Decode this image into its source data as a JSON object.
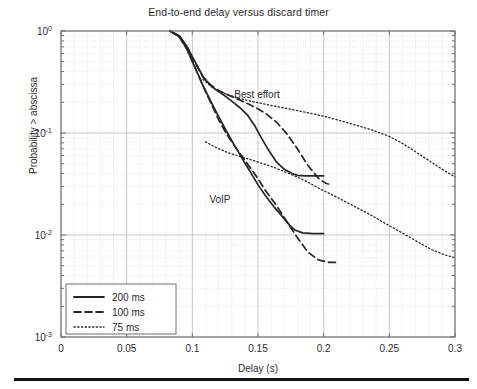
{
  "figure": {
    "title": "End-to-end delay versus discard timer",
    "bottom_rule": true
  },
  "axes": {
    "xlabel": "Delay (s)",
    "ylabel": "Probability > abscissa",
    "x_ticks": [
      "0",
      "0.05",
      "0.1",
      "0.15",
      "0.2",
      "0.25",
      "0.3"
    ],
    "y_ticks": [
      "10",
      "10",
      "10",
      "10"
    ],
    "y_exponents": [
      "0",
      "-1",
      "-2",
      "-3"
    ]
  },
  "legend": {
    "entries": [
      {
        "label": "200 ms",
        "style": "solid"
      },
      {
        "label": "100 ms",
        "style": "dashed"
      },
      {
        "label": "75 ms",
        "style": "dotted"
      }
    ]
  },
  "annotations": [
    {
      "text": "Best effort",
      "x": 0.132,
      "y": 0.22
    },
    {
      "text": "VoIP",
      "x": 0.113,
      "y": 0.0205
    }
  ],
  "colors": {
    "curve": "#262626",
    "axis": "#6f6f6f",
    "grid_major": "#b9b9b9",
    "grid_minor": "#d8d8d8",
    "text": "#2b2b2b",
    "rule": "#111111"
  },
  "chart_data": {
    "type": "line",
    "title": "End-to-end delay versus discard timer",
    "xlabel": "Delay (s)",
    "ylabel": "Probability > abscissa",
    "xlim": [
      0,
      0.3
    ],
    "ylim": [
      0.001,
      1
    ],
    "yscale": "log",
    "xscale": "linear",
    "grid": true,
    "legend_position": "lower-left",
    "legend_entries": [
      "200 ms",
      "100 ms",
      "75 ms"
    ],
    "groups": [
      "Best effort",
      "VoIP"
    ],
    "series": [
      {
        "name": "Best effort 200 ms",
        "group": "Best effort",
        "discard_timer_ms": 200,
        "style": "solid",
        "x": [
          0.083,
          0.09,
          0.096,
          0.102,
          0.108,
          0.113,
          0.118,
          0.124,
          0.13,
          0.136,
          0.142,
          0.148,
          0.152,
          0.158,
          0.164,
          0.17,
          0.176,
          0.18,
          0.186,
          0.192,
          0.2
        ],
        "y": [
          1.0,
          0.9,
          0.7,
          0.5,
          0.36,
          0.3,
          0.265,
          0.235,
          0.205,
          0.178,
          0.15,
          0.115,
          0.092,
          0.068,
          0.052,
          0.044,
          0.04,
          0.0385,
          0.038,
          0.038,
          0.038
        ]
      },
      {
        "name": "Best effort 100 ms",
        "group": "Best effort",
        "discard_timer_ms": 100,
        "style": "dashed",
        "x": [
          0.083,
          0.09,
          0.096,
          0.102,
          0.108,
          0.114,
          0.12,
          0.126,
          0.132,
          0.14,
          0.148,
          0.156,
          0.164,
          0.172,
          0.18,
          0.188,
          0.196,
          0.202,
          0.206
        ],
        "y": [
          1.0,
          0.9,
          0.7,
          0.49,
          0.355,
          0.295,
          0.262,
          0.24,
          0.222,
          0.2,
          0.178,
          0.155,
          0.128,
          0.098,
          0.07,
          0.048,
          0.036,
          0.032,
          0.031
        ]
      },
      {
        "name": "Best effort 75 ms",
        "group": "Best effort",
        "discard_timer_ms": 75,
        "style": "dotted",
        "x": [
          0.108,
          0.116,
          0.124,
          0.134,
          0.144,
          0.154,
          0.164,
          0.176,
          0.188,
          0.2,
          0.212,
          0.224,
          0.236,
          0.248,
          0.258,
          0.268,
          0.278,
          0.288,
          0.3
        ],
        "y": [
          0.335,
          0.275,
          0.245,
          0.222,
          0.205,
          0.193,
          0.182,
          0.17,
          0.158,
          0.146,
          0.133,
          0.12,
          0.108,
          0.095,
          0.082,
          0.068,
          0.056,
          0.046,
          0.037
        ]
      },
      {
        "name": "VoIP 200 ms",
        "group": "VoIP",
        "discard_timer_ms": 200,
        "style": "solid",
        "x": [
          0.083,
          0.09,
          0.096,
          0.102,
          0.108,
          0.114,
          0.12,
          0.126,
          0.132,
          0.138,
          0.144,
          0.15,
          0.156,
          0.162,
          0.168,
          0.174,
          0.178,
          0.184,
          0.192,
          0.2
        ],
        "y": [
          1.0,
          0.88,
          0.66,
          0.44,
          0.295,
          0.205,
          0.145,
          0.104,
          0.076,
          0.056,
          0.042,
          0.031,
          0.024,
          0.019,
          0.0155,
          0.0125,
          0.0112,
          0.0105,
          0.0103,
          0.0103
        ]
      },
      {
        "name": "VoIP 100 ms",
        "group": "VoIP",
        "discard_timer_ms": 100,
        "style": "dashed",
        "x": [
          0.083,
          0.09,
          0.096,
          0.102,
          0.108,
          0.114,
          0.12,
          0.126,
          0.132,
          0.14,
          0.148,
          0.156,
          0.164,
          0.172,
          0.18,
          0.188,
          0.196,
          0.204,
          0.21
        ],
        "y": [
          1.0,
          0.88,
          0.66,
          0.44,
          0.292,
          0.198,
          0.135,
          0.098,
          0.075,
          0.054,
          0.039,
          0.027,
          0.0195,
          0.0135,
          0.0094,
          0.0068,
          0.0057,
          0.0054,
          0.0054
        ]
      },
      {
        "name": "VoIP 75 ms",
        "group": "VoIP",
        "discard_timer_ms": 75,
        "style": "dotted",
        "x": [
          0.11,
          0.118,
          0.126,
          0.134,
          0.142,
          0.152,
          0.162,
          0.174,
          0.186,
          0.198,
          0.21,
          0.222,
          0.234,
          0.246,
          0.258,
          0.27,
          0.282,
          0.292,
          0.3
        ],
        "y": [
          0.082,
          0.072,
          0.065,
          0.06,
          0.056,
          0.051,
          0.046,
          0.04,
          0.034,
          0.028,
          0.0235,
          0.0195,
          0.0162,
          0.0132,
          0.0108,
          0.0088,
          0.0072,
          0.0064,
          0.006
        ]
      }
    ]
  }
}
